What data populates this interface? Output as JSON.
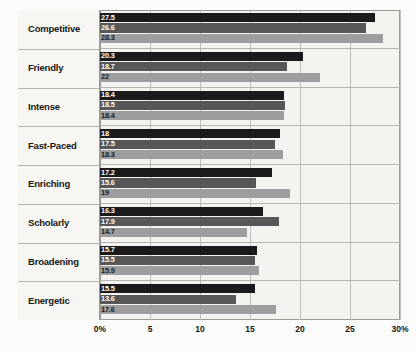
{
  "chart_data": {
    "type": "bar",
    "orientation": "horizontal",
    "title": "",
    "subtitle": "",
    "xlabel": "",
    "ylabel": "",
    "xlim": [
      0,
      30
    ],
    "grid": true,
    "legend": "none",
    "xticks": [
      0,
      5,
      10,
      15,
      20,
      25,
      30
    ],
    "xtick_labels": [
      "0%",
      "5",
      "10",
      "15",
      "20",
      "25",
      "30%"
    ],
    "categories": [
      "Competitive",
      "Friendly",
      "Intense",
      "Fast-Paced",
      "Enriching",
      "Scholarly",
      "Broadening",
      "Energetic"
    ],
    "series": [
      {
        "name": "series-1",
        "color": "#1b1b1b",
        "values": [
          27.5,
          20.3,
          18.4,
          18,
          17.2,
          16.3,
          15.7,
          15.5
        ],
        "labels": [
          "27.5",
          "20.3",
          "18.4",
          "18",
          "17.2",
          "16.3",
          "15.7",
          "15.5"
        ]
      },
      {
        "name": "series-2",
        "color": "#575757",
        "values": [
          26.6,
          18.7,
          18.5,
          17.5,
          15.6,
          17.9,
          15.5,
          13.6
        ],
        "labels": [
          "26.6",
          "18.7",
          "18.5",
          "17.5",
          "15.6",
          "17.9",
          "15.5",
          "13.6"
        ]
      },
      {
        "name": "series-3",
        "color": "#9d9d9d",
        "values": [
          28.3,
          22,
          18.4,
          18.3,
          19,
          14.7,
          15.9,
          17.6
        ],
        "labels": [
          "28.3",
          "22",
          "18.4",
          "18.3",
          "19",
          "14.7",
          "15.9",
          "17.6"
        ]
      }
    ]
  },
  "colors": {
    "series_1": "#1b1b1b",
    "series_2": "#575757",
    "series_3": "#9d9d9d",
    "background": "#f4f3ef",
    "frame": "#9a9a96",
    "gridline": "#bdbdb9",
    "text": "#161616"
  }
}
